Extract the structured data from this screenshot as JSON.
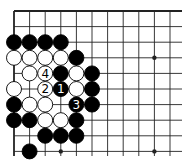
{
  "diagram": {
    "type": "go-board-fragment",
    "grid": {
      "origin_x": 14,
      "origin_y": 11,
      "spacing": 15.6,
      "columns": 11,
      "rows": 10,
      "extend_right_to": 182,
      "extend_bottom_to": 156,
      "edges": [
        "top",
        "left"
      ]
    },
    "colors": {
      "line": "#222222",
      "black_stone": "#000000",
      "white_stone": "#ffffff",
      "stone_outline": "#000000",
      "background": "#ffffff"
    },
    "star_points": [
      {
        "col": 9,
        "row": 3
      },
      {
        "col": 3,
        "row": 9
      },
      {
        "col": 9,
        "row": 9
      }
    ],
    "stones": [
      {
        "col": 0,
        "row": 2,
        "color": "black"
      },
      {
        "col": 1,
        "row": 2,
        "color": "black"
      },
      {
        "col": 2,
        "row": 2,
        "color": "black"
      },
      {
        "col": 3,
        "row": 2,
        "color": "black"
      },
      {
        "col": 0,
        "row": 3,
        "color": "white"
      },
      {
        "col": 1,
        "row": 3,
        "color": "white"
      },
      {
        "col": 2,
        "row": 3,
        "color": "white"
      },
      {
        "col": 3,
        "row": 3,
        "color": "white"
      },
      {
        "col": 4,
        "row": 3,
        "color": "black"
      },
      {
        "col": 1,
        "row": 4,
        "color": "white"
      },
      {
        "col": 2,
        "row": 4,
        "color": "white",
        "label": "4"
      },
      {
        "col": 3,
        "row": 4,
        "color": "black"
      },
      {
        "col": 4,
        "row": 4,
        "color": "white"
      },
      {
        "col": 5,
        "row": 4,
        "color": "black"
      },
      {
        "col": 0,
        "row": 5,
        "color": "white"
      },
      {
        "col": 2,
        "row": 5,
        "color": "white",
        "label": "2"
      },
      {
        "col": 3,
        "row": 5,
        "color": "black",
        "label": "1"
      },
      {
        "col": 4,
        "row": 5,
        "color": "white"
      },
      {
        "col": 5,
        "row": 5,
        "color": "black"
      },
      {
        "col": 0,
        "row": 6,
        "color": "black"
      },
      {
        "col": 1,
        "row": 6,
        "color": "white"
      },
      {
        "col": 2,
        "row": 6,
        "color": "white"
      },
      {
        "col": 4,
        "row": 6,
        "color": "black",
        "label": "3"
      },
      {
        "col": 5,
        "row": 6,
        "color": "black"
      },
      {
        "col": 0,
        "row": 7,
        "color": "black"
      },
      {
        "col": 1,
        "row": 7,
        "color": "black"
      },
      {
        "col": 2,
        "row": 7,
        "color": "white"
      },
      {
        "col": 3,
        "row": 7,
        "color": "white"
      },
      {
        "col": 4,
        "row": 7,
        "color": "black"
      },
      {
        "col": 2,
        "row": 8,
        "color": "black"
      },
      {
        "col": 3,
        "row": 8,
        "color": "black"
      },
      {
        "col": 4,
        "row": 8,
        "color": "black"
      },
      {
        "col": 1,
        "row": 9,
        "color": "black"
      }
    ]
  }
}
